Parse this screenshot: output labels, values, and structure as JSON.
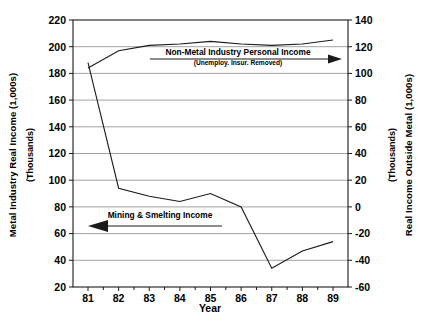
{
  "chart_data": {
    "type": "line",
    "title": "",
    "xlabel": "Year",
    "categories": [
      "81",
      "82",
      "83",
      "84",
      "85",
      "86",
      "87",
      "88",
      "89"
    ],
    "x": [
      81,
      82,
      83,
      84,
      85,
      86,
      87,
      88,
      89
    ],
    "grid": true,
    "legend_position": "inline-annotations",
    "left_axis": {
      "label": "Metal Industry Real Income (1,000s)",
      "sublabel": "(Thousands)",
      "ylim": [
        20,
        220
      ],
      "tick_step": 20,
      "ticks": [
        "220",
        "200",
        "180",
        "160",
        "140",
        "120",
        "100",
        "80",
        "60",
        "40",
        "20"
      ]
    },
    "right_axis": {
      "label": "Real Income Outside Metal (1,000s)",
      "sublabel": "(Thousands)",
      "ylim": [
        -60,
        140
      ],
      "tick_step": 20,
      "ticks": [
        "140",
        "120",
        "100",
        "80",
        "60",
        "40",
        "20",
        "0",
        "-20",
        "-40",
        "-60"
      ]
    },
    "series": [
      {
        "name": "Mining & Smelting Income",
        "axis": "left",
        "values": [
          188,
          94,
          88,
          84,
          90,
          80,
          34,
          47,
          54
        ]
      },
      {
        "name": "Non-Metal Industry Personal Income",
        "axis": "right",
        "values": [
          104,
          117,
          121,
          122,
          124,
          122,
          121,
          122,
          125
        ]
      }
    ],
    "annotations": [
      {
        "id": "non-metal-annotation",
        "label": "Non-Metal Industry Personal Income",
        "sublabel": "(Unemploy. Insur. Removed)",
        "arrow_direction": "right"
      },
      {
        "id": "mining-annotation",
        "label": "Mining & Smelting Income",
        "arrow_direction": "left"
      }
    ],
    "colors": {
      "line": "#1a1a1a",
      "grid": "#7a7a7a",
      "frame": "#1a1a1a",
      "background": "#ffffff"
    }
  }
}
